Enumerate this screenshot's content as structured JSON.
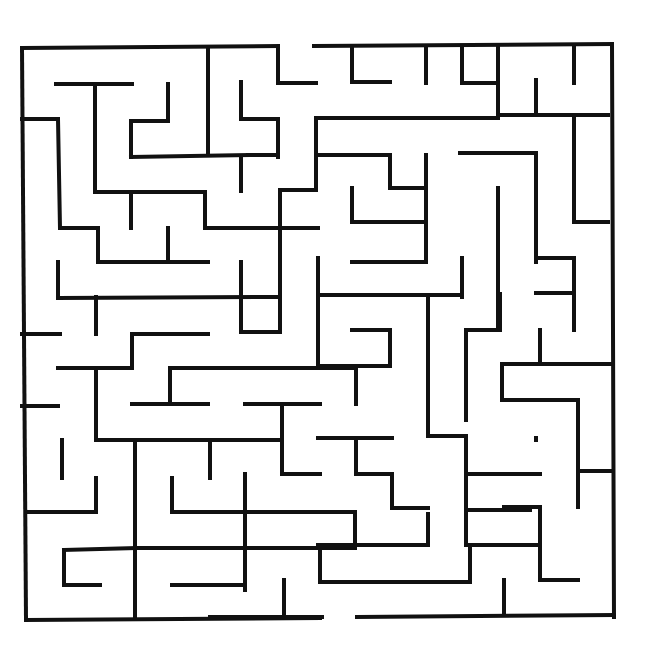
{
  "title_fragment": "",
  "maze": {
    "type": "rectangular-maze",
    "wall_color": "#111111",
    "background": "#ffffff",
    "border": {
      "left": 22,
      "top": 48,
      "right": 614,
      "bottom": 617
    },
    "entrance": {
      "side": "top",
      "x_from": 278,
      "x_to": 314
    },
    "exit": {
      "side": "bottom",
      "x_from": 320,
      "x_to": 357
    },
    "walls": [
      [
        22,
        48,
        278,
        46
      ],
      [
        314,
        46,
        612,
        44
      ],
      [
        612,
        44,
        614,
        617
      ],
      [
        357,
        617,
        614,
        615
      ],
      [
        26,
        620,
        320,
        618
      ],
      [
        22,
        48,
        26,
        620
      ],
      [
        208,
        48,
        208,
        155
      ],
      [
        278,
        48,
        278,
        83
      ],
      [
        278,
        83,
        316,
        83
      ],
      [
        56,
        84,
        132,
        84
      ],
      [
        95,
        84,
        95,
        192
      ],
      [
        168,
        84,
        168,
        121
      ],
      [
        131,
        121,
        168,
        121
      ],
      [
        131,
        121,
        131,
        157
      ],
      [
        131,
        157,
        248,
        155
      ],
      [
        22,
        119,
        58,
        119
      ],
      [
        58,
        119,
        60,
        228
      ],
      [
        60,
        228,
        98,
        228
      ],
      [
        98,
        228,
        98,
        262
      ],
      [
        98,
        262,
        208,
        262
      ],
      [
        241,
        82,
        241,
        119
      ],
      [
        241,
        119,
        278,
        119
      ],
      [
        278,
        119,
        278,
        157
      ],
      [
        248,
        155,
        278,
        155
      ],
      [
        241,
        157,
        241,
        191
      ],
      [
        95,
        192,
        205,
        192
      ],
      [
        205,
        192,
        205,
        228
      ],
      [
        205,
        228,
        318,
        228
      ],
      [
        131,
        192,
        131,
        228
      ],
      [
        168,
        228,
        168,
        262
      ],
      [
        352,
        46,
        352,
        82
      ],
      [
        352,
        82,
        390,
        82
      ],
      [
        426,
        48,
        426,
        83
      ],
      [
        498,
        46,
        498,
        82
      ],
      [
        462,
        48,
        462,
        83
      ],
      [
        462,
        83,
        498,
        83
      ],
      [
        498,
        83,
        498,
        118
      ],
      [
        316,
        118,
        316,
        157
      ],
      [
        316,
        118,
        498,
        118
      ],
      [
        316,
        155,
        390,
        155
      ],
      [
        390,
        155,
        390,
        188
      ],
      [
        390,
        188,
        426,
        188
      ],
      [
        426,
        155,
        426,
        228
      ],
      [
        536,
        80,
        536,
        115
      ],
      [
        498,
        115,
        608,
        115
      ],
      [
        574,
        48,
        574,
        83
      ],
      [
        574,
        115,
        574,
        222
      ],
      [
        460,
        153,
        536,
        153
      ],
      [
        536,
        153,
        536,
        262
      ],
      [
        498,
        188,
        498,
        327
      ],
      [
        280,
        190,
        280,
        228
      ],
      [
        280,
        190,
        316,
        190
      ],
      [
        316,
        190,
        316,
        157
      ],
      [
        352,
        188,
        352,
        222
      ],
      [
        352,
        222,
        426,
        222
      ],
      [
        426,
        222,
        426,
        262
      ],
      [
        352,
        262,
        426,
        262
      ],
      [
        462,
        258,
        462,
        297
      ],
      [
        574,
        222,
        608,
        222
      ],
      [
        536,
        258,
        574,
        258
      ],
      [
        574,
        258,
        574,
        330
      ],
      [
        536,
        293,
        574,
        293
      ],
      [
        58,
        262,
        58,
        298
      ],
      [
        58,
        298,
        280,
        297
      ],
      [
        241,
        262,
        241,
        332
      ],
      [
        241,
        332,
        280,
        332
      ],
      [
        280,
        228,
        280,
        332
      ],
      [
        96,
        297,
        96,
        334
      ],
      [
        318,
        258,
        318,
        366
      ],
      [
        318,
        295,
        462,
        295
      ],
      [
        352,
        330,
        390,
        330
      ],
      [
        390,
        330,
        390,
        366
      ],
      [
        318,
        366,
        390,
        366
      ],
      [
        22,
        334,
        60,
        334
      ],
      [
        58,
        368,
        132,
        368
      ],
      [
        132,
        334,
        132,
        368
      ],
      [
        132,
        334,
        208,
        334
      ],
      [
        170,
        368,
        352,
        368
      ],
      [
        170,
        368,
        170,
        402
      ],
      [
        96,
        368,
        96,
        440
      ],
      [
        22,
        406,
        58,
        406
      ],
      [
        132,
        404,
        208,
        404
      ],
      [
        245,
        404,
        320,
        404
      ],
      [
        282,
        404,
        282,
        474
      ],
      [
        282,
        474,
        320,
        474
      ],
      [
        356,
        368,
        356,
        404
      ],
      [
        428,
        295,
        428,
        436
      ],
      [
        466,
        330,
        500,
        330
      ],
      [
        466,
        330,
        466,
        420
      ],
      [
        500,
        330,
        500,
        294
      ],
      [
        540,
        330,
        540,
        364
      ],
      [
        502,
        364,
        612,
        364
      ],
      [
        502,
        364,
        502,
        400
      ],
      [
        502,
        400,
        578,
        400
      ],
      [
        578,
        400,
        578,
        507
      ],
      [
        578,
        471,
        612,
        471
      ],
      [
        96,
        440,
        282,
        440
      ],
      [
        62,
        440,
        62,
        478
      ],
      [
        210,
        440,
        210,
        478
      ],
      [
        96,
        478,
        96,
        512
      ],
      [
        26,
        512,
        96,
        512
      ],
      [
        135,
        440,
        135,
        618
      ],
      [
        318,
        438,
        392,
        438
      ],
      [
        356,
        438,
        356,
        474
      ],
      [
        356,
        474,
        392,
        474
      ],
      [
        392,
        474,
        392,
        508
      ],
      [
        392,
        508,
        428,
        508
      ],
      [
        428,
        436,
        466,
        436
      ],
      [
        466,
        436,
        466,
        510
      ],
      [
        466,
        474,
        540,
        474
      ],
      [
        466,
        510,
        466,
        545
      ],
      [
        466,
        510,
        530,
        510
      ],
      [
        536,
        440,
        536,
        438
      ],
      [
        245,
        474,
        245,
        590
      ],
      [
        172,
        478,
        172,
        512
      ],
      [
        172,
        512,
        355,
        512
      ],
      [
        210,
        548,
        355,
        548
      ],
      [
        355,
        512,
        355,
        548
      ],
      [
        428,
        514,
        428,
        545
      ],
      [
        318,
        545,
        428,
        545
      ],
      [
        320,
        545,
        320,
        582
      ],
      [
        320,
        582,
        470,
        582
      ],
      [
        470,
        548,
        470,
        582
      ],
      [
        504,
        507,
        540,
        507
      ],
      [
        540,
        507,
        540,
        545
      ],
      [
        64,
        550,
        135,
        548
      ],
      [
        64,
        550,
        64,
        585
      ],
      [
        64,
        585,
        100,
        585
      ],
      [
        135,
        548,
        210,
        548
      ],
      [
        172,
        585,
        245,
        585
      ],
      [
        284,
        580,
        284,
        617
      ],
      [
        210,
        617,
        322,
        617
      ],
      [
        466,
        545,
        504,
        545
      ],
      [
        504,
        545,
        540,
        545
      ],
      [
        540,
        545,
        540,
        580
      ],
      [
        540,
        580,
        578,
        580
      ],
      [
        504,
        580,
        504,
        615
      ]
    ]
  }
}
